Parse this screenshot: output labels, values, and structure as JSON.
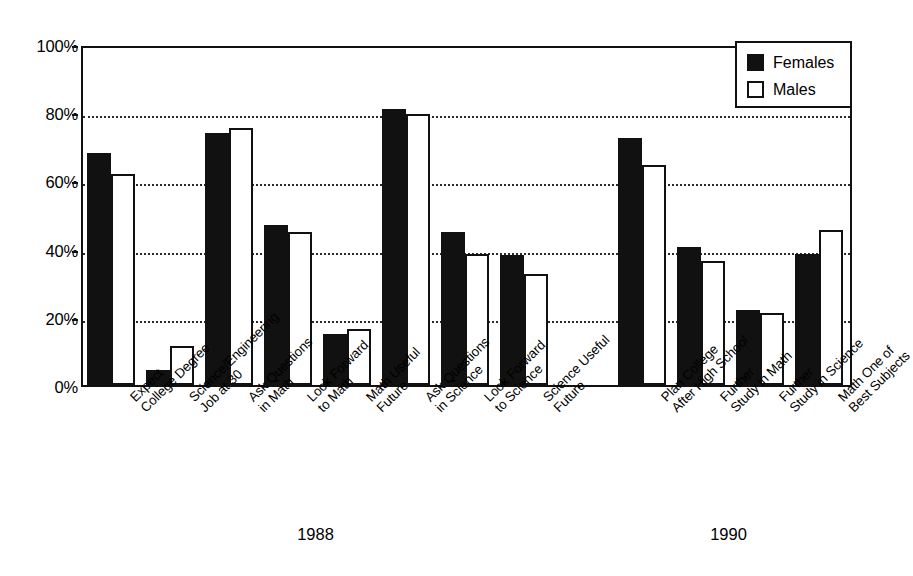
{
  "chart_data": {
    "type": "bar",
    "title": "",
    "subtitle": "",
    "xlabel": "",
    "ylabel": "",
    "ylim": [
      0,
      100
    ],
    "y_unit": "%",
    "grid": true,
    "grid_axis": "y",
    "legend_position": "top-right",
    "yticks": [
      "0%",
      "20%",
      "40%",
      "60%",
      "80%",
      "100%"
    ],
    "ytick_values": [
      0,
      20,
      40,
      60,
      80,
      100
    ],
    "group_labels": [
      "1988",
      "1990"
    ],
    "categories": [
      "Expect\nCollege Degree",
      "Science/Engineering\nJob at 30",
      "Ask Questions\nin Math",
      "Look Forward\nto Math",
      "Math Useful\nFuture",
      "Ask Questions\nin Science",
      "Look Forward\nto Science",
      "Science Useful\nFuture",
      "Plan College\nAfter High School",
      "Further\nStudy in Math",
      "Further\nStudy in Science",
      "Math One of\nBest Subjects"
    ],
    "category_group": [
      "1988",
      "1988",
      "1988",
      "1988",
      "1988",
      "1988",
      "1988",
      "1988",
      "1990",
      "1990",
      "1990",
      "1990"
    ],
    "series": [
      {
        "name": "Females",
        "color": "#111111",
        "values": [
          68,
          4.5,
          74,
          47,
          15,
          81,
          45,
          38,
          72.5,
          40.5,
          22,
          38.5
        ]
      },
      {
        "name": "Males",
        "color": "#ffffff",
        "values": [
          62,
          11.5,
          75.5,
          45,
          16.5,
          79.5,
          38.5,
          32.5,
          64.5,
          36.5,
          21,
          45.5
        ]
      }
    ]
  },
  "legend": {
    "items": [
      {
        "label": "Females",
        "style": "female"
      },
      {
        "label": "Males",
        "style": "male"
      }
    ]
  },
  "colors": {
    "female_fill": "#111111",
    "male_fill": "#ffffff",
    "axis": "#111111",
    "grid": "#2a2a2a",
    "background": "#ffffff"
  }
}
